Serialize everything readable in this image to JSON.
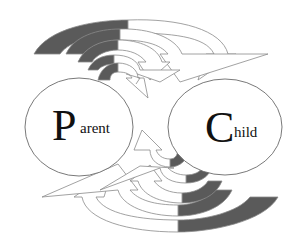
{
  "diagram": {
    "type": "parent-child-flow",
    "colors": {
      "tail_fill": "#5a5a5a",
      "arrow_fill": "#ffffff",
      "stroke": "#8a8a8a",
      "node_stroke": "#6a6a6a",
      "text": "#111111"
    },
    "nodes": [
      {
        "id": "parent",
        "initial": "P",
        "rest": "arent",
        "label": "Parent"
      },
      {
        "id": "child",
        "initial": "C",
        "rest": "hild",
        "label": "Child"
      }
    ],
    "flows": [
      {
        "from": "parent",
        "to": "child",
        "position": "top",
        "arrow_count": 5
      },
      {
        "from": "child",
        "to": "parent",
        "position": "bottom",
        "arrow_count": 5
      }
    ]
  }
}
